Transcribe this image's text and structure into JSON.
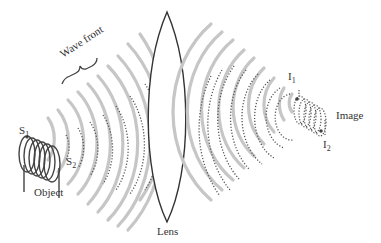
{
  "diagram": {
    "labels": {
      "wave_front": "Wave front",
      "s1": "S",
      "s1_sub": "1",
      "s2": "S",
      "s2_sub": "2",
      "object": "Object",
      "lens": "Lens",
      "i1": "I",
      "i1_sub": "1",
      "i2": "I",
      "i2_sub": "2",
      "image": "Image"
    },
    "colors": {
      "wave_gray": "#c4c4c4",
      "dotted": "#555555",
      "lens_outline": "#333333",
      "coil": "#444444",
      "text": "#333333"
    }
  }
}
